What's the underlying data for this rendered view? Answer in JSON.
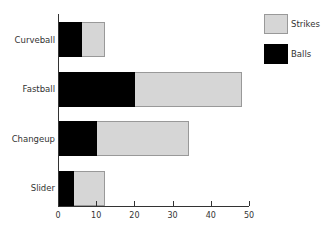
{
  "chart_data": {
    "type": "bar",
    "orientation": "horizontal",
    "stacked": true,
    "title": "",
    "xlabel": "",
    "ylabel": "",
    "categories": [
      "Curveball",
      "Fastball",
      "Changeup",
      "Slider"
    ],
    "series": [
      {
        "name": "Balls",
        "color": "#000000",
        "values": [
          6,
          20,
          10,
          4
        ]
      },
      {
        "name": "Strikes",
        "color": "#d6d6d6",
        "values": [
          6,
          28,
          24,
          8
        ]
      }
    ],
    "totals": [
      12,
      48,
      34,
      12
    ],
    "xlim": [
      0,
      50
    ],
    "xticks": [
      0,
      10,
      20,
      30,
      40,
      50
    ],
    "grid": false,
    "legend": {
      "position": "upper right",
      "entries": [
        "Strikes",
        "Balls"
      ]
    }
  },
  "legend": {
    "strikes_label": "Strikes",
    "balls_label": "Balls"
  },
  "axis": {
    "ticks": [
      "0",
      "10",
      "20",
      "30",
      "40",
      "50"
    ]
  },
  "categories": {
    "c0": "Curveball",
    "c1": "Fastball",
    "c2": "Changeup",
    "c3": "Slider"
  }
}
